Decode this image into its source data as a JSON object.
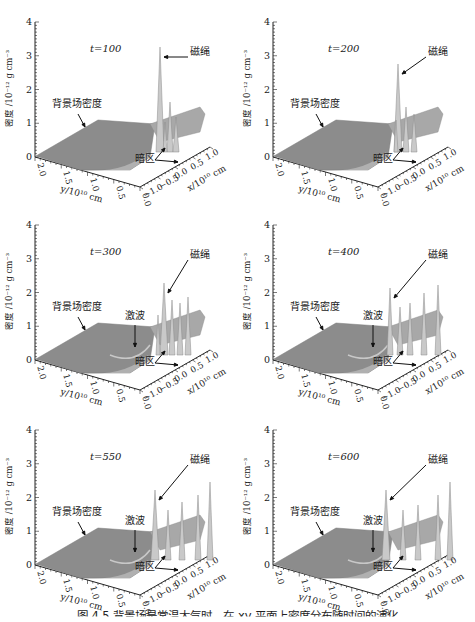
{
  "figure": {
    "caption": "图 4.5  背景场是常温大气时，在 xy 平面上密度分布随时间的演化"
  },
  "axes_common": {
    "zlabel": "密度 /10⁻¹² g cm⁻³",
    "ylabel": "y/10¹⁰ cm",
    "xlabel": "x/10¹⁰ cm",
    "zticks": [
      "0",
      "1",
      "2",
      "3",
      "4"
    ],
    "yticks": [
      "2.0",
      "1.5",
      "1.0",
      "0.5",
      "0.0"
    ],
    "xticks": [
      "−1.0",
      "−0.5",
      "0.0",
      "0.5",
      "1.0"
    ]
  },
  "panels": [
    {
      "title": "t=100",
      "rope_label": "磁绳",
      "bg_label": "背景场密度",
      "dark_label": "暗区",
      "shock_label": ""
    },
    {
      "title": "t=200",
      "rope_label": "磁绳",
      "bg_label": "背景场密度",
      "dark_label": "暗区",
      "shock_label": ""
    },
    {
      "title": "t=300",
      "rope_label": "磁绳",
      "bg_label": "背景场密度",
      "dark_label": "暗区",
      "shock_label": "激波"
    },
    {
      "title": "t=400",
      "rope_label": "磁绳",
      "bg_label": "背景场密度",
      "dark_label": "暗区",
      "shock_label": "激波"
    },
    {
      "title": "t=550",
      "rope_label": "磁绳",
      "bg_label": "背景场密度",
      "dark_label": "暗区",
      "shock_label": "激波"
    },
    {
      "title": "t=600",
      "rope_label": "磁绳",
      "bg_label": "背景场密度",
      "dark_label": "暗区",
      "shock_label": "激波"
    }
  ],
  "chart_data": [
    {
      "type": "surface3d",
      "title": "t=100",
      "zlabel": "密度 /10⁻¹² g cm⁻³",
      "ylabel": "y/10¹⁰ cm",
      "xlabel": "x/10¹⁰ cm",
      "zlim": [
        0,
        4
      ],
      "ylim": [
        0.0,
        2.0
      ],
      "xlim": [
        -1.0,
        1.0
      ],
      "background_density": 1.0,
      "peak_density": 3.0,
      "annotations": [
        "t=100",
        "磁绳",
        "背景场密度",
        "暗区"
      ]
    },
    {
      "type": "surface3d",
      "title": "t=200",
      "zlabel": "密度 /10⁻¹² g cm⁻³",
      "ylabel": "y/10¹⁰ cm",
      "xlabel": "x/10¹⁰ cm",
      "zlim": [
        0,
        4
      ],
      "ylim": [
        0.0,
        2.0
      ],
      "xlim": [
        -1.0,
        1.0
      ],
      "background_density": 1.0,
      "peak_density": 2.6,
      "annotations": [
        "t=200",
        "磁绳",
        "背景场密度",
        "暗区"
      ]
    },
    {
      "type": "surface3d",
      "title": "t=300",
      "zlabel": "密度 /10⁻¹² g cm⁻³",
      "ylabel": "y/10¹⁰ cm",
      "xlabel": "x/10¹⁰ cm",
      "zlim": [
        0,
        4
      ],
      "ylim": [
        0.0,
        2.0
      ],
      "xlim": [
        -1.0,
        1.0
      ],
      "background_density": 1.0,
      "peak_density": 2.2,
      "annotations": [
        "t=300",
        "磁绳",
        "背景场密度",
        "激波",
        "暗区"
      ]
    },
    {
      "type": "surface3d",
      "title": "t=400",
      "zlabel": "密度 /10⁻¹² g cm⁻³",
      "ylabel": "y/10¹⁰ cm",
      "xlabel": "x/10¹⁰ cm",
      "zlim": [
        0,
        4
      ],
      "ylim": [
        0.0,
        2.0
      ],
      "xlim": [
        -1.0,
        1.0
      ],
      "background_density": 1.0,
      "peak_density": 2.2,
      "annotations": [
        "t=400",
        "磁绳",
        "背景场密度",
        "激波",
        "暗区"
      ]
    },
    {
      "type": "surface3d",
      "title": "t=550",
      "zlabel": "密度 /10⁻¹² g cm⁻³",
      "ylabel": "y/10¹⁰ cm",
      "xlabel": "x/10¹⁰ cm",
      "zlim": [
        0,
        4
      ],
      "ylim": [
        0.0,
        2.0
      ],
      "xlim": [
        -1.0,
        1.0
      ],
      "background_density": 1.0,
      "peak_density": 2.3,
      "annotations": [
        "t=550",
        "磁绳",
        "背景场密度",
        "激波",
        "暗区"
      ]
    },
    {
      "type": "surface3d",
      "title": "t=600",
      "zlabel": "密度 /10⁻¹² g cm⁻³",
      "ylabel": "y/10¹⁰ cm",
      "xlabel": "x/10¹⁰ cm",
      "zlim": [
        0,
        4
      ],
      "ylim": [
        0.0,
        2.0
      ],
      "xlim": [
        -1.0,
        1.0
      ],
      "background_density": 1.0,
      "peak_density": 2.3,
      "annotations": [
        "t=600",
        "磁绳",
        "背景场密度",
        "激波",
        "暗区"
      ]
    }
  ]
}
